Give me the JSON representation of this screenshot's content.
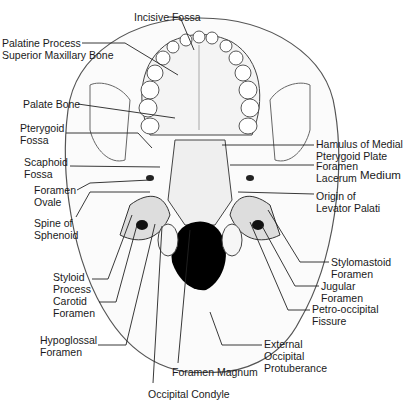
{
  "diagram": {
    "labels": [
      {
        "id": "incisive-fossa",
        "text": "Incisive Fossa",
        "x": 134,
        "y": 11
      },
      {
        "id": "palatine-process",
        "text": "Palatine Process\nSuperior Maxillary Bone",
        "x": 2,
        "y": 37
      },
      {
        "id": "palate-bone",
        "text": "Palate Bone",
        "x": 23,
        "y": 98
      },
      {
        "id": "pterygoid-fossa",
        "text": "Pterygoid\nFossa",
        "x": 20,
        "y": 122
      },
      {
        "id": "scaphoid-fossa",
        "text": "Scaphoid\nFossa",
        "x": 24,
        "y": 156
      },
      {
        "id": "foramen-ovale",
        "text": "Foramen\nOvale",
        "x": 34,
        "y": 184
      },
      {
        "id": "spine-of-sphenoid",
        "text": "Spine of\nSphenoid",
        "x": 34,
        "y": 217
      },
      {
        "id": "styloid-process",
        "text": "Styloid\nProcess",
        "x": 53,
        "y": 271
      },
      {
        "id": "carotid-foramen",
        "text": "Carotid\nForamen",
        "x": 53,
        "y": 295
      },
      {
        "id": "hypoglossal-foramen",
        "text": "Hypoglossal\nForamen",
        "x": 40,
        "y": 334
      },
      {
        "id": "occipital-condyle",
        "text": "Occipital Condyle",
        "x": 148,
        "y": 388
      },
      {
        "id": "foramen-magnum",
        "text": "Foramen Magnum",
        "x": 172,
        "y": 366
      },
      {
        "id": "external-occipital-protuberance",
        "text": "External\nOccipital\nProtuberance",
        "x": 264,
        "y": 338
      },
      {
        "id": "petro-occipital-fissure",
        "text": "Petro-occipital\nFissure",
        "x": 312,
        "y": 303
      },
      {
        "id": "jugular-foramen",
        "text": "Jugular\nForamen",
        "x": 321,
        "y": 280
      },
      {
        "id": "stylomastoid-foramen",
        "text": "Stylomastoid\nForamen",
        "x": 331,
        "y": 256
      },
      {
        "id": "origin-levator-palati",
        "text": "Origin of\nLevator Palati",
        "x": 316,
        "y": 190
      },
      {
        "id": "foramen-lacerum",
        "text": "Foramen\nLacerum",
        "x": 316,
        "y": 160
      },
      {
        "id": "foramen-lacerum-medium",
        "text": "Medium",
        "x": 360,
        "y": 169,
        "big": true
      },
      {
        "id": "hamulus-medial-pterygoid",
        "text": "Hamulus of Medial\nPterygoid Plate",
        "x": 316,
        "y": 140
      }
    ]
  }
}
